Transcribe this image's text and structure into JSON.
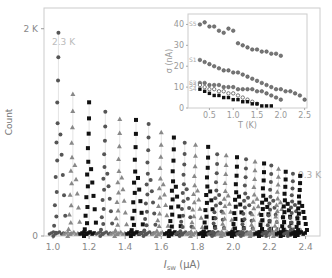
{
  "chart_data": [
    {
      "type": "scatter",
      "title": "",
      "xlabel": "I_sw (μA)",
      "ylabel": "Count",
      "xlim": [
        0.95,
        2.48
      ],
      "ylim": [
        0,
        2200
      ],
      "xticks": [
        "1.0",
        "1.2",
        "1.4",
        "1.6",
        "1.8",
        "2.0",
        "2.2",
        "2.4"
      ],
      "yticks": [
        "0",
        "2 K"
      ],
      "annotations": [
        "2.3 K",
        "0.3 K"
      ],
      "grid": false,
      "description": "Switching current histograms at temperatures from 2.3 K (left) down to 0.3 K (right), alternating markers circle/triangle/square",
      "series": [
        {
          "marker": "circle",
          "color": "#555555",
          "peak_x": 1.03,
          "peak": 1960
        },
        {
          "marker": "triangle",
          "color": "#888888",
          "peak_x": 1.11,
          "peak": 1370
        },
        {
          "marker": "square",
          "color": "#111111",
          "peak_x": 1.2,
          "peak": 1290
        },
        {
          "marker": "circle",
          "color": "#555555",
          "peak_x": 1.29,
          "peak": 1200
        },
        {
          "marker": "triangle",
          "color": "#888888",
          "peak_x": 1.37,
          "peak": 1130
        },
        {
          "marker": "square",
          "color": "#111111",
          "peak_x": 1.46,
          "peak": 1120
        },
        {
          "marker": "circle",
          "color": "#555555",
          "peak_x": 1.53,
          "peak": 1080
        },
        {
          "marker": "triangle",
          "color": "#888888",
          "peak_x": 1.6,
          "peak": 1000
        },
        {
          "marker": "square",
          "color": "#111111",
          "peak_x": 1.67,
          "peak": 950
        },
        {
          "marker": "circle",
          "color": "#555555",
          "peak_x": 1.73,
          "peak": 900
        },
        {
          "marker": "triangle",
          "color": "#888888",
          "peak_x": 1.79,
          "peak": 880
        },
        {
          "marker": "square",
          "color": "#111111",
          "peak_x": 1.86,
          "peak": 860
        },
        {
          "marker": "circle",
          "color": "#555555",
          "peak_x": 1.91,
          "peak": 790
        },
        {
          "marker": "triangle",
          "color": "#888888",
          "peak_x": 1.96,
          "peak": 780
        },
        {
          "marker": "square",
          "color": "#111111",
          "peak_x": 2.02,
          "peak": 760
        },
        {
          "marker": "circle",
          "color": "#555555",
          "peak_x": 2.07,
          "peak": 740
        },
        {
          "marker": "triangle",
          "color": "#888888",
          "peak_x": 2.12,
          "peak": 720
        },
        {
          "marker": "square",
          "color": "#111111",
          "peak_x": 2.17,
          "peak": 700
        },
        {
          "marker": "circle",
          "color": "#555555",
          "peak_x": 2.21,
          "peak": 680
        },
        {
          "marker": "triangle",
          "color": "#888888",
          "peak_x": 2.25,
          "peak": 650
        },
        {
          "marker": "square",
          "color": "#111111",
          "peak_x": 2.29,
          "peak": 620
        },
        {
          "marker": "circle",
          "color": "#555555",
          "peak_x": 2.33,
          "peak": 600
        },
        {
          "marker": "square",
          "color": "#111111",
          "peak_x": 2.37,
          "peak": 580
        }
      ]
    },
    {
      "type": "scatter",
      "title": "inset",
      "xlabel": "T (K)",
      "ylabel": "σ (nA)",
      "xlim": [
        0.05,
        2.55
      ],
      "ylim": [
        0,
        45
      ],
      "xticks": [
        "0.5",
        "1.0",
        "1.5",
        "2.0",
        "2.5"
      ],
      "yticks": [
        "0",
        "10",
        "20",
        "30",
        "40"
      ],
      "legend": [
        "S5",
        "S1",
        "S2",
        "S3",
        "S4"
      ],
      "series": [
        {
          "name": "S5",
          "marker": "circle",
          "x": [
            0.3,
            0.4,
            0.5,
            0.6,
            0.7,
            0.8,
            0.9,
            1.0,
            1.1,
            1.2,
            1.3,
            1.4,
            1.5,
            1.6,
            1.7,
            1.8,
            1.9,
            2.0
          ],
          "values": [
            40,
            41,
            39,
            39,
            37,
            36,
            38,
            37,
            31,
            30,
            29,
            28,
            28,
            27,
            27,
            26,
            26,
            25
          ]
        },
        {
          "name": "S1",
          "marker": "circle",
          "x": [
            0.3,
            0.4,
            0.5,
            0.6,
            0.7,
            0.8,
            0.9,
            1.0,
            1.1,
            1.2,
            1.3,
            1.4,
            1.5,
            1.6,
            1.7,
            1.8,
            1.9,
            2.0,
            2.1,
            2.2,
            2.3,
            2.4,
            2.5
          ],
          "values": [
            23,
            22,
            21,
            20,
            19,
            18,
            18,
            17,
            17,
            16,
            15,
            14,
            13,
            12,
            11,
            10,
            9,
            9,
            8,
            8,
            7,
            6,
            4
          ]
        },
        {
          "name": "S2",
          "marker": "circle",
          "x": [
            0.3,
            0.4,
            0.5,
            0.6,
            0.7,
            0.8,
            0.9,
            1.0,
            1.1,
            1.2,
            1.3,
            1.4,
            1.5,
            1.6,
            1.7,
            1.8,
            1.9,
            2.0
          ],
          "values": [
            12,
            12,
            11,
            11,
            11,
            10,
            10,
            10,
            9,
            9,
            9,
            9,
            8,
            8,
            7,
            6,
            5,
            4
          ]
        },
        {
          "name": "S3",
          "marker": "open-circle",
          "x": [
            0.3,
            0.4,
            0.5,
            0.6,
            0.7,
            0.8,
            0.9,
            1.0,
            1.1,
            1.2,
            1.3,
            1.4,
            1.5
          ],
          "values": [
            11,
            10,
            9,
            9,
            8,
            8,
            7,
            7,
            6,
            5,
            4,
            3,
            2
          ]
        },
        {
          "name": "S4",
          "marker": "square",
          "x": [
            0.3,
            0.4,
            0.5,
            0.6,
            0.7,
            0.8,
            0.9,
            1.0,
            1.1,
            1.2,
            1.3,
            1.4,
            1.5,
            1.6,
            1.7,
            1.8
          ],
          "values": [
            9,
            8,
            7,
            6,
            6,
            5,
            5,
            4,
            4,
            3,
            3,
            2,
            2,
            1,
            1,
            1
          ]
        }
      ]
    }
  ]
}
